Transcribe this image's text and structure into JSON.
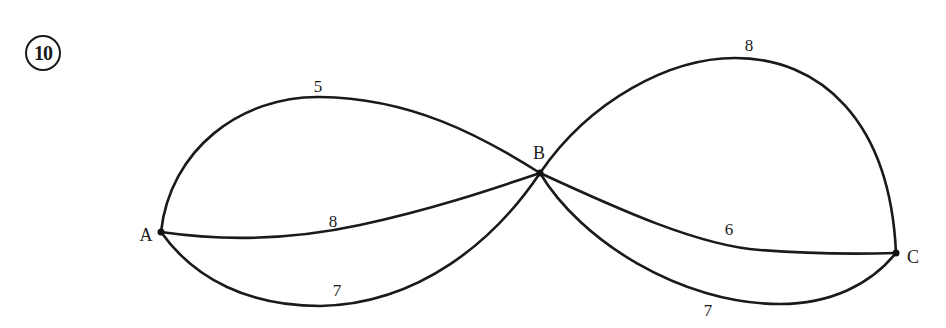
{
  "problem": {
    "number": "10"
  },
  "graph": {
    "nodes": [
      {
        "id": "A",
        "label": "A",
        "x": 161,
        "y": 232,
        "label_x": 146,
        "label_y": 235
      },
      {
        "id": "B",
        "label": "B",
        "x": 540,
        "y": 173,
        "label_x": 539,
        "label_y": 153
      },
      {
        "id": "C",
        "label": "C",
        "x": 896,
        "y": 253,
        "label_x": 913,
        "label_y": 257
      }
    ],
    "edges": [
      {
        "from": "A",
        "to": "B",
        "weight": "5",
        "position": "upper",
        "label_x": 318,
        "label_y": 86
      },
      {
        "from": "A",
        "to": "B",
        "weight": "8",
        "position": "middle",
        "label_x": 333,
        "label_y": 221
      },
      {
        "from": "A",
        "to": "B",
        "weight": "7",
        "position": "lower",
        "label_x": 337,
        "label_y": 290
      },
      {
        "from": "B",
        "to": "C",
        "weight": "8",
        "position": "upper",
        "label_x": 749,
        "label_y": 45
      },
      {
        "from": "B",
        "to": "C",
        "weight": "6",
        "position": "middle",
        "label_x": 729,
        "label_y": 229
      },
      {
        "from": "B",
        "to": "C",
        "weight": "7",
        "position": "lower",
        "label_x": 708,
        "label_y": 310
      }
    ]
  },
  "colors": {
    "stroke": "#1a1a1a",
    "background": "#ffffff"
  }
}
